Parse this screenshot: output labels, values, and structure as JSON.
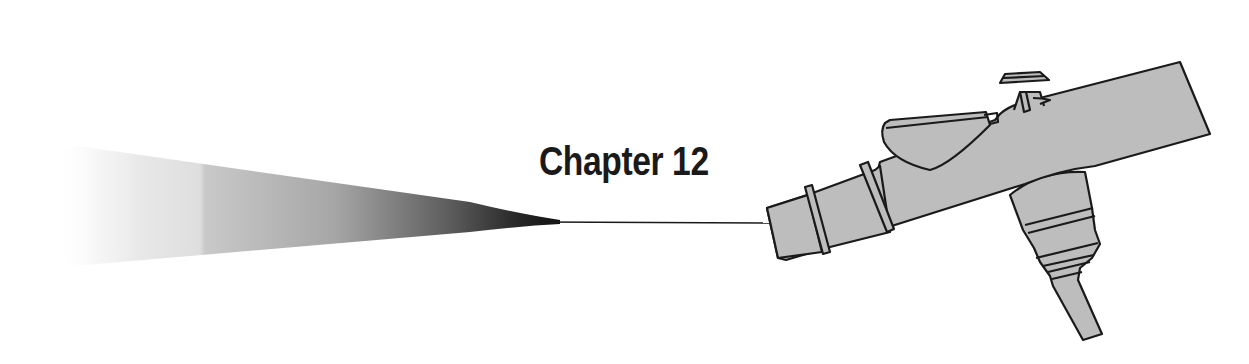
{
  "page": {
    "heading": "Chapter 12"
  },
  "illustration": {
    "subject": "airbrush-spraying",
    "icons": [
      "spray-cone-icon",
      "spray-line-icon",
      "airbrush-icon"
    ],
    "colors": {
      "background": "#ffffff",
      "airbrush_fill": "#bdbdbd",
      "outline": "#1a1a1a",
      "spray_dark": "#1a1a1a",
      "spray_light": "#f4f4f4"
    }
  }
}
